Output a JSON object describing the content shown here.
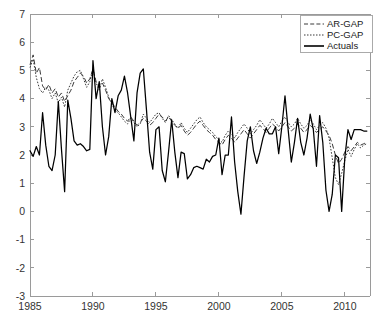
{
  "chart_data": {
    "type": "line",
    "title": "",
    "xlabel": "",
    "ylabel": "",
    "xlim": [
      1985.0,
      2012.0
    ],
    "ylim": [
      -3,
      7
    ],
    "grid": false,
    "legend_position": "top-right",
    "xticks": [
      1985,
      1990,
      1995,
      2000,
      2005,
      2010
    ],
    "xtick_labels": [
      "1985",
      "1990",
      "1995",
      "2000",
      "2005",
      "2010"
    ],
    "yticks": [
      -3,
      -2,
      -1,
      0,
      1,
      2,
      3,
      4,
      5,
      6,
      7
    ],
    "ytick_labels": [
      "-3",
      "-2",
      "-1",
      "0",
      "1",
      "2",
      "3",
      "4",
      "5",
      "6",
      "7"
    ],
    "legend": [
      "AR-GAP",
      "PC-GAP",
      "Actuals"
    ],
    "x": [
      1985.0,
      1985.25,
      1985.5,
      1985.75,
      1986.0,
      1986.25,
      1986.5,
      1986.75,
      1987.0,
      1987.25,
      1987.5,
      1987.75,
      1988.0,
      1988.25,
      1988.5,
      1988.75,
      1989.0,
      1989.25,
      1989.5,
      1989.75,
      1990.0,
      1990.25,
      1990.5,
      1990.75,
      1991.0,
      1991.25,
      1991.5,
      1991.75,
      1992.0,
      1992.25,
      1992.5,
      1992.75,
      1993.0,
      1993.25,
      1993.5,
      1993.75,
      1994.0,
      1994.25,
      1994.5,
      1994.75,
      1995.0,
      1995.25,
      1995.5,
      1995.75,
      1996.0,
      1996.25,
      1996.5,
      1996.75,
      1997.0,
      1997.25,
      1997.5,
      1997.75,
      1998.0,
      1998.25,
      1998.5,
      1998.75,
      1999.0,
      1999.25,
      1999.5,
      1999.75,
      2000.0,
      2000.25,
      2000.5,
      2000.75,
      2001.0,
      2001.25,
      2001.5,
      2001.75,
      2002.0,
      2002.25,
      2002.5,
      2002.75,
      2003.0,
      2003.25,
      2003.5,
      2003.75,
      2004.0,
      2004.25,
      2004.5,
      2004.75,
      2005.0,
      2005.25,
      2005.5,
      2005.75,
      2006.0,
      2006.25,
      2006.5,
      2006.75,
      2007.0,
      2007.25,
      2007.5,
      2007.75,
      2008.0,
      2008.25,
      2008.5,
      2008.75,
      2009.0,
      2009.25,
      2009.5,
      2009.75,
      2010.0,
      2010.25,
      2010.5,
      2010.75,
      2011.0,
      2011.25,
      2011.5,
      2011.75
    ],
    "series": [
      {
        "name": "AR-GAP",
        "style": "dashed",
        "values": [
          5.2,
          5.55,
          4.9,
          5.1,
          4.45,
          4.3,
          4.5,
          4.2,
          4.35,
          4.05,
          4.2,
          3.9,
          4.1,
          4.3,
          4.6,
          4.75,
          4.9,
          4.8,
          4.55,
          4.7,
          5.05,
          4.6,
          4.4,
          4.55,
          4.3,
          4.0,
          3.85,
          3.7,
          3.55,
          3.45,
          3.3,
          3.2,
          3.35,
          3.2,
          3.05,
          3.15,
          3.3,
          3.2,
          3.05,
          3.15,
          3.3,
          3.45,
          3.35,
          3.2,
          3.35,
          3.2,
          3.05,
          2.95,
          3.05,
          2.85,
          2.7,
          2.8,
          2.95,
          3.1,
          3.2,
          3.05,
          2.9,
          2.8,
          2.7,
          2.55,
          2.45,
          2.35,
          2.55,
          2.7,
          2.6,
          2.45,
          2.6,
          2.75,
          2.9,
          2.75,
          2.6,
          2.75,
          2.9,
          3.05,
          2.95,
          2.8,
          2.95,
          3.1,
          3.0,
          2.85,
          3.0,
          3.15,
          3.0,
          2.85,
          2.95,
          3.1,
          2.95,
          2.8,
          2.9,
          3.05,
          2.95,
          2.8,
          2.9,
          3.0,
          2.85,
          2.7,
          2.4,
          2.0,
          1.7,
          1.85,
          2.1,
          2.3,
          2.15,
          2.3,
          2.45,
          2.35,
          2.4,
          2.45
        ]
      },
      {
        "name": "PC-GAP",
        "style": "dotted",
        "values": [
          5.1,
          5.4,
          4.75,
          4.35,
          4.2,
          4.4,
          4.3,
          4.0,
          4.2,
          3.85,
          4.05,
          3.7,
          4.3,
          4.55,
          4.8,
          4.95,
          5.0,
          4.7,
          4.4,
          4.6,
          5.05,
          4.55,
          4.3,
          4.7,
          4.4,
          4.05,
          3.8,
          3.6,
          3.5,
          3.35,
          3.2,
          3.1,
          3.3,
          3.15,
          3.0,
          3.1,
          3.45,
          3.3,
          3.15,
          3.3,
          3.45,
          3.5,
          3.3,
          3.15,
          3.4,
          3.25,
          3.1,
          2.95,
          3.15,
          2.95,
          2.8,
          2.95,
          3.1,
          3.25,
          3.35,
          3.15,
          3.0,
          2.9,
          2.8,
          2.65,
          2.55,
          2.45,
          2.7,
          2.85,
          2.75,
          2.6,
          2.8,
          2.95,
          3.1,
          2.95,
          2.75,
          2.9,
          3.05,
          3.25,
          3.1,
          2.95,
          3.1,
          3.3,
          3.15,
          3.0,
          3.2,
          3.35,
          3.15,
          3.0,
          3.1,
          3.3,
          3.1,
          2.95,
          3.05,
          3.25,
          3.1,
          2.9,
          3.05,
          3.15,
          2.95,
          2.6,
          1.9,
          1.2,
          0.95,
          1.35,
          1.8,
          2.2,
          1.95,
          2.2,
          2.4,
          2.25,
          2.35,
          2.4
        ]
      },
      {
        "name": "Actuals",
        "style": "solid",
        "values": [
          2.15,
          1.95,
          2.3,
          2.0,
          3.5,
          2.35,
          1.6,
          1.45,
          2.0,
          3.9,
          2.2,
          0.7,
          3.95,
          3.3,
          2.5,
          2.35,
          2.4,
          2.3,
          2.15,
          2.2,
          5.35,
          4.0,
          4.6,
          3.0,
          2.0,
          2.65,
          4.0,
          3.5,
          4.1,
          4.3,
          4.8,
          4.2,
          3.35,
          2.5,
          4.2,
          4.9,
          5.05,
          3.6,
          2.1,
          1.5,
          2.9,
          3.0,
          1.45,
          1.05,
          2.1,
          3.25,
          2.1,
          1.2,
          2.1,
          2.05,
          1.15,
          1.3,
          1.55,
          1.6,
          1.55,
          1.5,
          1.85,
          1.75,
          1.95,
          2.0,
          2.6,
          1.3,
          2.0,
          2.0,
          3.35,
          1.75,
          0.7,
          -0.1,
          1.25,
          2.5,
          3.0,
          2.15,
          1.7,
          2.1,
          2.6,
          2.95,
          2.75,
          2.75,
          3.0,
          2.05,
          3.0,
          4.1,
          2.9,
          1.75,
          2.45,
          3.3,
          2.45,
          2.0,
          2.6,
          3.45,
          2.9,
          1.6,
          3.4,
          2.45,
          0.75,
          0.0,
          0.6,
          2.0,
          1.9,
          0.0,
          1.9,
          2.9,
          2.55,
          2.9,
          2.9,
          2.9,
          2.85,
          2.85
        ]
      }
    ]
  }
}
